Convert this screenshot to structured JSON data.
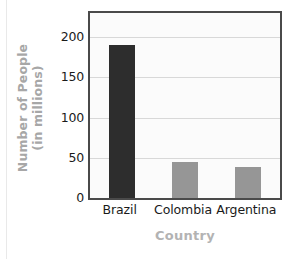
{
  "chart_data": {
    "type": "bar",
    "title": "",
    "xlabel": "Country",
    "ylabel_line1": "Number of People",
    "ylabel_line2": "(in millions)",
    "ylabel": "Number of People (in millions)",
    "categories": [
      "Brazil",
      "Colombia",
      "Argentina"
    ],
    "values": [
      190,
      45,
      38
    ],
    "ylim": [
      0,
      230
    ],
    "yticks": [
      0,
      50,
      100,
      150,
      200
    ],
    "ytick_labels": [
      "0",
      "50",
      "100",
      "150",
      "200"
    ],
    "grid": "horizontal",
    "legend": "none",
    "series": [
      {
        "name": "Number of People (in millions)",
        "values": [
          190,
          45,
          38
        ]
      }
    ],
    "bar_colors": [
      "#2d2d2d",
      "#969696",
      "#969696"
    ],
    "colors": {
      "plot_background": "#fbfbfb",
      "frame": "#4a4a4a",
      "gridline": "#d8d8d8",
      "tick_text": "#1a1a1a",
      "axis_title": "#b0b0b0",
      "page_background": "#ffffff"
    }
  }
}
